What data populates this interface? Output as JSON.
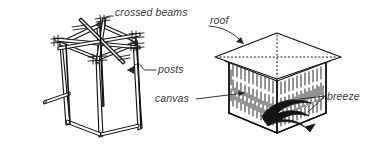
{
  "figure": {
    "type": "hand-drawn technical illustration",
    "background_color": "#ffffff",
    "ink_color": "#1a1a1a",
    "label_color": "#3a3a3a"
  },
  "labels": {
    "crossed_beams": "crossed beams",
    "posts": "posts",
    "roof": "roof",
    "canvas": "canvas",
    "breeze": "breeze"
  },
  "icons": {
    "crossed_beams_leader": "curved-leader-arrow-icon",
    "posts_leader": "squiggle-leader-arrow-icon",
    "roof_leader": "curved-leader-arrow-icon",
    "canvas_leader": "straight-leader-line-icon",
    "breeze_leader": "straight-leader-line-icon",
    "breeze_swirl": "breeze-swirl-arrow-icon"
  },
  "diagrams": {
    "left": {
      "name": "bare-frame",
      "description": "cube post-and-beam frame with crossed diagonal top beams"
    },
    "right": {
      "name": "finished-shelter",
      "description": "shelter with hipped roof panel and hatched canvas walls"
    }
  }
}
